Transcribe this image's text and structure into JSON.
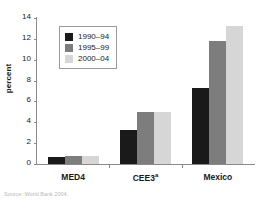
{
  "chart_data": {
    "type": "bar",
    "title": "",
    "xlabel": "",
    "ylabel": "percent",
    "ylim": [
      0,
      14
    ],
    "ytick_step": 2,
    "yticks": [
      14,
      12,
      10,
      8,
      6,
      4,
      2,
      0
    ],
    "grid": false,
    "legend_position": "upper-left-inside",
    "categories": [
      "MED4",
      "CEE3",
      "Mexico"
    ],
    "category_superscripts": [
      "",
      "a",
      ""
    ],
    "series": [
      {
        "name": "1990–94",
        "color": "#1a1a1a",
        "values": [
          0.7,
          3.3,
          7.3
        ]
      },
      {
        "name": "1995–99",
        "color": "#7d7d7d",
        "values": [
          0.75,
          5.0,
          11.8
        ]
      },
      {
        "name": "2000–04",
        "color": "#d6d6d6",
        "values": [
          0.8,
          5.0,
          13.2
        ]
      }
    ]
  },
  "legend": {
    "items": [
      {
        "label": "1990–94",
        "swatch": "black-swatch"
      },
      {
        "label": "1995–99",
        "swatch": "gray-swatch"
      },
      {
        "label": "2000–04",
        "swatch": "light-gray-swatch"
      }
    ]
  },
  "axis": {
    "y_label": "percent",
    "y_ticks": [
      "14",
      "12",
      "10",
      "8",
      "6",
      "4",
      "2",
      "0"
    ]
  },
  "x_categories": [
    {
      "label": "MED4",
      "sup": ""
    },
    {
      "label": "CEE3",
      "sup": "a"
    },
    {
      "label": "Mexico",
      "sup": ""
    }
  ],
  "source_note": "Source: World Bank 2004.",
  "colors": {
    "series_1": "#1a1a1a",
    "series_2": "#7d7d7d",
    "series_3": "#d6d6d6",
    "axis": "#8a8a8a",
    "text": "#1a1a1a",
    "background": "#ffffff"
  }
}
